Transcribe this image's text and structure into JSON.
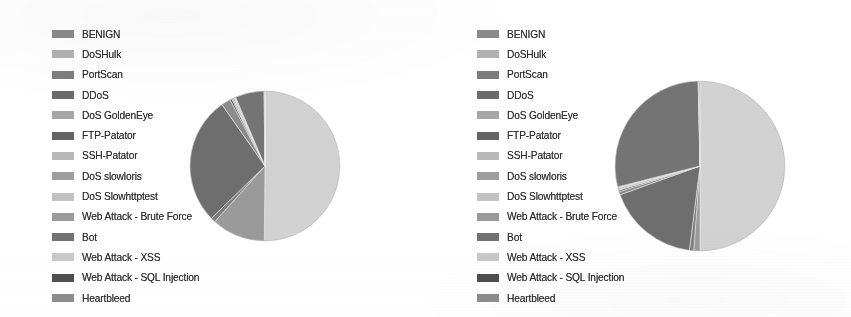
{
  "figure": {
    "background_color": "#ffffff",
    "text_color": "#2e2e2e",
    "panel_count": 2
  },
  "palette": {
    "benign": "#d2d2d2",
    "doshulk": "#9a9a9a",
    "portscan": "#7e7e7e",
    "ddos": "#6e6e6e",
    "dos_goldeneye": "#8c8c8c",
    "ftp_patator": "#5e5e5e",
    "ssh_patator": "#a9a9a9",
    "dos_slowloris": "#909090",
    "dos_slowhttptest": "#bdbdbd",
    "web_brute_force": "#a0a0a0",
    "bot": "#747474",
    "web_xss": "#c4c4c4",
    "web_sql_injection": "#4a4a4a",
    "heartbleed": "#868686",
    "outline": "#8f8f8f"
  },
  "legend": {
    "entries": [
      {
        "label": "BENIGN",
        "color": "#8a8a8a"
      },
      {
        "label": "DoSHulk",
        "color": "#b2b2b2"
      },
      {
        "label": "PortScan",
        "color": "#7d7d7d"
      },
      {
        "label": "DDoS",
        "color": "#6b6b6b"
      },
      {
        "label": "DoS GoldenEye",
        "color": "#a6a6a6"
      },
      {
        "label": "FTP-Patator",
        "color": "#636363"
      },
      {
        "label": "SSH-Patator",
        "color": "#b8b8b8"
      },
      {
        "label": "DoS slowloris",
        "color": "#9d9d9d"
      },
      {
        "label": "DoS Slowhttptest",
        "color": "#c2c2c2"
      },
      {
        "label": "Web Attack - Brute Force",
        "color": "#9a9a9a"
      },
      {
        "label": "Bot",
        "color": "#737373"
      },
      {
        "label": "Web Attack - XSS",
        "color": "#c8c8c8"
      },
      {
        "label": "Web Attack - SQL Injection",
        "color": "#4f4f4f"
      },
      {
        "label": "Heartbleed",
        "color": "#8d8d8d"
      }
    ]
  },
  "chart_data": [
    {
      "type": "pie",
      "title": "",
      "panel": "left",
      "legend_position": "left",
      "center_px": [
        265,
        166
      ],
      "radius_px": 75,
      "start_angle_deg": 90,
      "direction": "clockwise",
      "categories": [
        "BENIGN",
        "DoSHulk",
        "PortScan",
        "DDoS",
        "DoS GoldenEye",
        "FTP-Patator",
        "SSH-Patator",
        "DoS slowloris",
        "DoS Slowhttptest",
        "Web Attack - Brute Force",
        "Bot",
        "Web Attack - XSS",
        "Web Attack - SQL Injection",
        "Heartbleed"
      ],
      "values": [
        50.0,
        11.5,
        1.0,
        27.5,
        2.0,
        0.4,
        0.3,
        0.25,
        0.2,
        0.15,
        6.2,
        0.1,
        0.05,
        0.05
      ],
      "colors": [
        "#d2d2d2",
        "#9a9a9a",
        "#7e7e7e",
        "#6e6e6e",
        "#8c8c8c",
        "#5e5e5e",
        "#a9a9a9",
        "#909090",
        "#bdbdbd",
        "#a0a0a0",
        "#747474",
        "#c4c4c4",
        "#4a4a4a",
        "#868686"
      ],
      "units": "percent"
    },
    {
      "type": "pie",
      "title": "",
      "panel": "right",
      "legend_position": "left",
      "center_px": [
        700,
        166
      ],
      "radius_px": 85,
      "start_angle_deg": 90,
      "direction": "clockwise",
      "categories": [
        "BENIGN",
        "DoSHulk",
        "PortScan",
        "DDoS",
        "DoS GoldenEye",
        "FTP-Patator",
        "SSH-Patator",
        "DoS slowloris",
        "DoS Slowhttptest",
        "Web Attack - Brute Force",
        "Bot",
        "Web Attack - XSS",
        "Web Attack - SQL Injection",
        "Heartbleed"
      ],
      "values": [
        50.0,
        1.2,
        0.8,
        17.5,
        0.6,
        0.3,
        0.2,
        0.2,
        0.15,
        0.1,
        28.6,
        0.1,
        0.1,
        0.15
      ],
      "colors": [
        "#d2d2d2",
        "#9a9a9a",
        "#7e7e7e",
        "#6e6e6e",
        "#8c8c8c",
        "#5e5e5e",
        "#a9a9a9",
        "#909090",
        "#bdbdbd",
        "#a0a0a0",
        "#747474",
        "#c4c4c4",
        "#4a4a4a",
        "#868686"
      ],
      "units": "percent"
    }
  ]
}
